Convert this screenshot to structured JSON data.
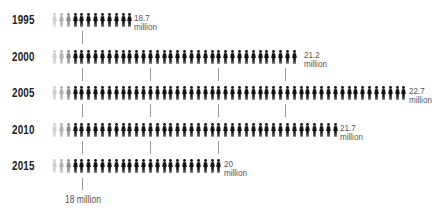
{
  "chart_data": {
    "type": "pictogram-bar",
    "title": "",
    "unit": "million",
    "categories": [
      "1995",
      "2000",
      "2005",
      "2010",
      "2015"
    ],
    "values": [
      18.7,
      21.2,
      22.7,
      21.7,
      20
    ],
    "value_labels": [
      "18.7",
      "21.2",
      "22.7",
      "21.7",
      "20"
    ],
    "figure_counts": [
      12,
      36,
      52,
      42,
      25
    ],
    "reference_ticks": [
      18,
      19,
      20,
      21,
      22
    ],
    "axis_label": "18 million",
    "x_scale": {
      "start_value": 18,
      "start_px": 82,
      "px_per_million": 67.8
    },
    "figure_colors": [
      "#cfcfcf",
      "#b2b2b2",
      "#8a8a8a",
      "#111111"
    ],
    "grid": false,
    "legend": null
  },
  "rows": [
    {
      "year": "1995",
      "value": "18.7",
      "unit": "million"
    },
    {
      "year": "2000",
      "value": "21.2",
      "unit": "million"
    },
    {
      "year": "2005",
      "value": "22.7",
      "unit": "million"
    },
    {
      "year": "2010",
      "value": "21.7",
      "unit": "million"
    },
    {
      "year": "2015",
      "value": "20",
      "unit": "million"
    }
  ],
  "axis": {
    "label": "18 million"
  }
}
